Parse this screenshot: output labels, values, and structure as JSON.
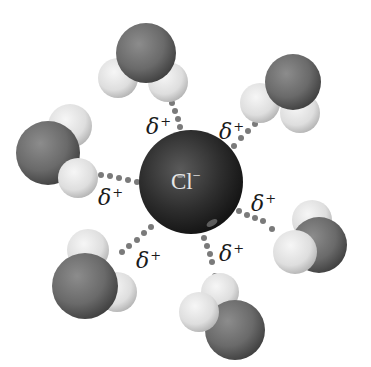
{
  "diagram": {
    "central_ion": {
      "symbol": "Cl",
      "charge": "−",
      "color": "#2e2e2e"
    },
    "partial_charge_label": {
      "symbol": "δ",
      "sign": "+"
    },
    "water_molecules": [
      {
        "id": "top",
        "label_symbol": "δ",
        "label_sign": "+"
      },
      {
        "id": "upper-right",
        "label_symbol": "δ",
        "label_sign": "+"
      },
      {
        "id": "left",
        "label_symbol": "δ",
        "label_sign": "+"
      },
      {
        "id": "right",
        "label_symbol": "δ",
        "label_sign": "+"
      },
      {
        "id": "lower-left",
        "label_symbol": "δ",
        "label_sign": "+"
      },
      {
        "id": "bottom",
        "label_symbol": "δ",
        "label_sign": "+"
      }
    ],
    "colors": {
      "oxygen": "#6e6e6e",
      "hydrogen": "#e2e2e2",
      "chloride": "#2a2a2a",
      "hydrogen_bond_dots": "#7a7a7a"
    }
  }
}
